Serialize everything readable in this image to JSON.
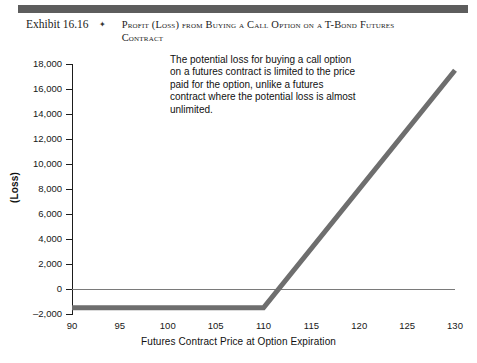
{
  "header": {
    "exhibit_number": "Exhibit 16.16",
    "separator_icon": "diamond-bullet",
    "title": "Profit (Loss) from Buying a Call Option on a T-Bond Futures Contract",
    "bar_color": "#5d5d5d"
  },
  "annotation": {
    "text": "The potential loss for buying a call option on a futures contract is limited to the price paid for the option, unlike a futures contract where the potential loss is almost unlimited."
  },
  "chart_data": {
    "type": "line",
    "title": "Profit (Loss) from Buying a Call Option on a T-Bond Futures Contract",
    "xlabel": "Futures Contract Price at Option Expiration",
    "ylabel": "(Loss)",
    "xlim": [
      88,
      132
    ],
    "ylim": [
      -2000,
      18000
    ],
    "xticks": [
      90,
      95,
      100,
      105,
      110,
      115,
      120,
      125,
      130
    ],
    "xtick_labels": [
      "90",
      "95",
      "100",
      "105",
      "110",
      "115",
      "120",
      "125",
      "130"
    ],
    "yticks": [
      -2000,
      0,
      2000,
      4000,
      6000,
      8000,
      10000,
      12000,
      14000,
      16000,
      18000
    ],
    "ytick_labels": [
      "–2,000",
      "0",
      "2,000",
      "4,000",
      "6,000",
      "8,000",
      "10,000",
      "12,000",
      "14,000",
      "16,000",
      "18,000"
    ],
    "grid": false,
    "legend": false,
    "zero_line": true,
    "series": [
      {
        "name": "Call option payoff",
        "color": "#6e6e6e",
        "line_width": 5,
        "x": [
          90,
          110,
          130
        ],
        "values": [
          -1500,
          -1500,
          17500
        ],
        "strike": 110,
        "premium": 1500,
        "breakeven": 111.5
      }
    ]
  }
}
